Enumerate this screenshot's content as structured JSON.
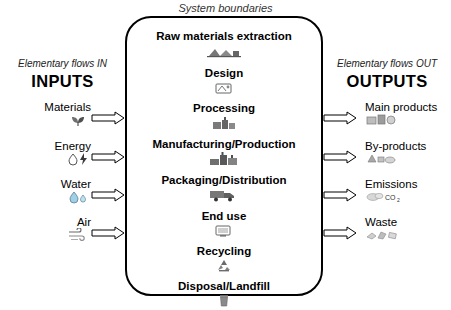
{
  "diagram": {
    "system_label": "System boundaries",
    "left": {
      "subtitle": "Elementary flows IN",
      "title": "INPUTS",
      "items": [
        {
          "label": "Materials",
          "icon": "material-sample-icon"
        },
        {
          "label": "Energy",
          "icon": "energy-drop-bolt-icon"
        },
        {
          "label": "Water",
          "icon": "water-drops-icon"
        },
        {
          "label": "Air",
          "icon": "air-swirl-icon"
        }
      ]
    },
    "right": {
      "subtitle": "Elementary flows OUT",
      "title": "OUTPUTS",
      "items": [
        {
          "label": "Main products",
          "icon": "product-box-icon",
          "note": ""
        },
        {
          "label": "By-products",
          "icon": "byproduct-icon",
          "note": ""
        },
        {
          "label": "Emissions",
          "icon": "emissions-cloud-icon",
          "note": "CO2"
        },
        {
          "label": "Waste",
          "icon": "waste-icon",
          "note": ""
        }
      ]
    },
    "stages": [
      {
        "label": "Raw materials extraction",
        "icon": "quarry-icon"
      },
      {
        "label": "Design",
        "icon": "drafting-icon"
      },
      {
        "label": "Processing",
        "icon": "factory-icon"
      },
      {
        "label": "Manufacturing/Production",
        "icon": "plant-icon"
      },
      {
        "label": "Packaging/Distribution",
        "icon": "truck-icon"
      },
      {
        "label": "End use",
        "icon": "use-icon"
      },
      {
        "label": "Recycling",
        "icon": "recycle-icon"
      },
      {
        "label": "Disposal/Landfill",
        "icon": "bin-icon"
      }
    ],
    "colors": {
      "boundary": "#000000",
      "text": "#000000",
      "icon": "#555555",
      "background": "#ffffff"
    }
  }
}
